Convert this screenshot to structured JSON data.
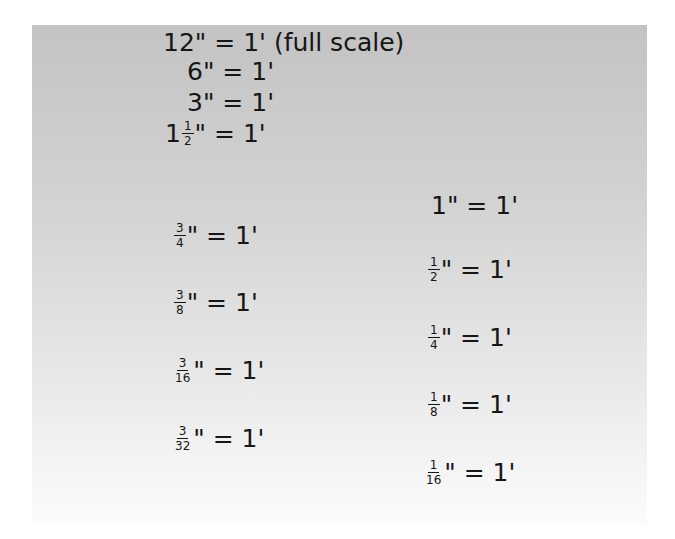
{
  "left_column": [
    {
      "id": "12in",
      "whole": "12",
      "num": "",
      "den": "",
      "rest": "\" = 1' (full scale)"
    },
    {
      "id": "6in",
      "whole": "6",
      "num": "",
      "den": "",
      "rest": "\" = 1'"
    },
    {
      "id": "3in",
      "whole": "3",
      "num": "",
      "den": "",
      "rest": "\" = 1'"
    },
    {
      "id": "1-1-2in",
      "whole": "1",
      "num": "1",
      "den": "2",
      "rest": "\" = 1'"
    },
    {
      "id": "3-4in",
      "whole": "",
      "num": "3",
      "den": "4",
      "rest": "\" = 1'"
    },
    {
      "id": "3-8in",
      "whole": "",
      "num": "3",
      "den": "8",
      "rest": "\" = 1'"
    },
    {
      "id": "3-16in",
      "whole": "",
      "num": "3",
      "den": "16",
      "rest": "\" = 1'"
    },
    {
      "id": "3-32in",
      "whole": "",
      "num": "3",
      "den": "32",
      "rest": "\" = 1'"
    }
  ],
  "right_column": [
    {
      "id": "1in",
      "whole": "1",
      "num": "",
      "den": "",
      "rest": "\" = 1'"
    },
    {
      "id": "1-2in",
      "whole": "",
      "num": "1",
      "den": "2",
      "rest": "\" = 1'"
    },
    {
      "id": "1-4in",
      "whole": "",
      "num": "1",
      "den": "4",
      "rest": "\" = 1'"
    },
    {
      "id": "1-8in",
      "whole": "",
      "num": "1",
      "den": "8",
      "rest": "\" = 1'"
    },
    {
      "id": "1-16in",
      "whole": "",
      "num": "1",
      "den": "16",
      "rest": "\" = 1'"
    }
  ],
  "colors": {
    "text": "#161616",
    "panel_top": "#c3c3c3",
    "panel_bottom": "#fcfcfc"
  }
}
